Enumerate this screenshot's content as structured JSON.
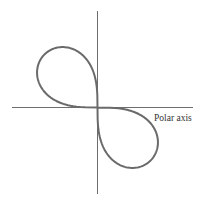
{
  "diagram": {
    "type": "polar-curve",
    "curve": {
      "name": "lemniscate",
      "equation": "r^2 = -a^2 sin(2θ)",
      "lobes": [
        "second quadrant",
        "fourth quadrant"
      ],
      "color": "#6a6a6a"
    },
    "axes": {
      "horizontal_label": "Polar axis",
      "color": "#6e6e6e"
    }
  }
}
